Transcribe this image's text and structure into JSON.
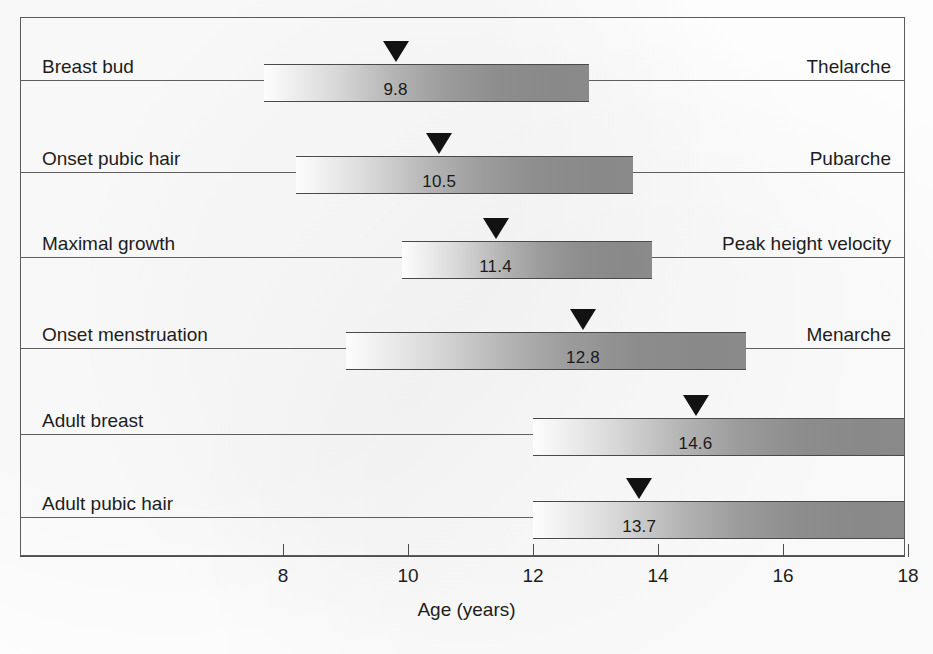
{
  "chart_data": {
    "type": "bar",
    "subtype": "horizontal-range-bar-with-median-marker",
    "title": "",
    "xlabel": "Age (years)",
    "ylabel": "",
    "xlim": [
      6.0,
      18.0
    ],
    "xticks": [
      8,
      10,
      12,
      14,
      16,
      18
    ],
    "xticklabels": [
      "8",
      "10",
      "12",
      "14",
      "16",
      "18"
    ],
    "grid": false,
    "legend": null,
    "categories": [
      "Breast bud",
      "Onset pubic hair",
      "Maximal growth",
      "Onset menstruation",
      "Adult breast",
      "Adult pubic hair"
    ],
    "right_labels": [
      "Thelarche",
      "Pubarche",
      "Peak height velocity",
      "Menarche",
      "",
      ""
    ],
    "median_values": [
      9.8,
      10.5,
      11.4,
      12.8,
      14.6,
      13.7
    ],
    "value_labels": [
      "9.8",
      "10.5",
      "11.4",
      "12.8",
      "14.6",
      "13.7"
    ],
    "range_start": [
      7.7,
      8.2,
      9.9,
      9.0,
      12.0,
      12.0
    ],
    "range_end": [
      12.9,
      13.6,
      13.9,
      15.4,
      18.0,
      18.0
    ],
    "series": [
      {
        "name": "Breast bud",
        "right_label": "Thelarche",
        "start": 7.7,
        "end": 12.9,
        "median": 9.8,
        "value_label": "9.8"
      },
      {
        "name": "Onset pubic hair",
        "right_label": "Pubarche",
        "start": 8.2,
        "end": 13.6,
        "median": 10.5,
        "value_label": "10.5"
      },
      {
        "name": "Maximal growth",
        "right_label": "Peak height velocity",
        "start": 9.9,
        "end": 13.9,
        "median": 11.4,
        "value_label": "11.4"
      },
      {
        "name": "Onset menstruation",
        "right_label": "Menarche",
        "start": 9.0,
        "end": 15.4,
        "median": 12.8,
        "value_label": "12.8"
      },
      {
        "name": "Adult breast",
        "right_label": "",
        "start": 12.0,
        "end": 18.0,
        "median": 14.6,
        "value_label": "14.6"
      },
      {
        "name": "Adult pubic hair",
        "right_label": "",
        "start": 12.0,
        "end": 18.0,
        "median": 13.7,
        "value_label": "13.7"
      }
    ]
  },
  "axis": {
    "title": "Age (years)",
    "ticks": [
      {
        "value": 8,
        "label": "8"
      },
      {
        "value": 10,
        "label": "10"
      },
      {
        "value": 12,
        "label": "12"
      },
      {
        "value": 14,
        "label": "14"
      },
      {
        "value": 16,
        "label": "16"
      },
      {
        "value": 18,
        "label": "18"
      }
    ]
  },
  "rows": [
    {
      "left_label": "Breast bud",
      "right_label": "Thelarche",
      "value_label": "9.8"
    },
    {
      "left_label": "Onset pubic hair",
      "right_label": "Pubarche",
      "value_label": "10.5"
    },
    {
      "left_label": "Maximal growth",
      "right_label": "Peak height velocity",
      "value_label": "11.4"
    },
    {
      "left_label": "Onset menstruation",
      "right_label": "Menarche",
      "value_label": "12.8"
    },
    {
      "left_label": "Adult breast",
      "right_label": "",
      "value_label": "14.6"
    },
    {
      "left_label": "Adult pubic hair",
      "right_label": "",
      "value_label": "13.7"
    }
  ],
  "colors": {
    "frame": "#5b5b5b",
    "row_line": "#5e5e5e",
    "bar_border": "#4a4a4a",
    "bar_gradient_from": "#fdfdfd",
    "bar_gradient_to": "#8a8a8a",
    "marker": "#121212",
    "text": "#1d1d1d",
    "background": "#fdfdfd"
  }
}
